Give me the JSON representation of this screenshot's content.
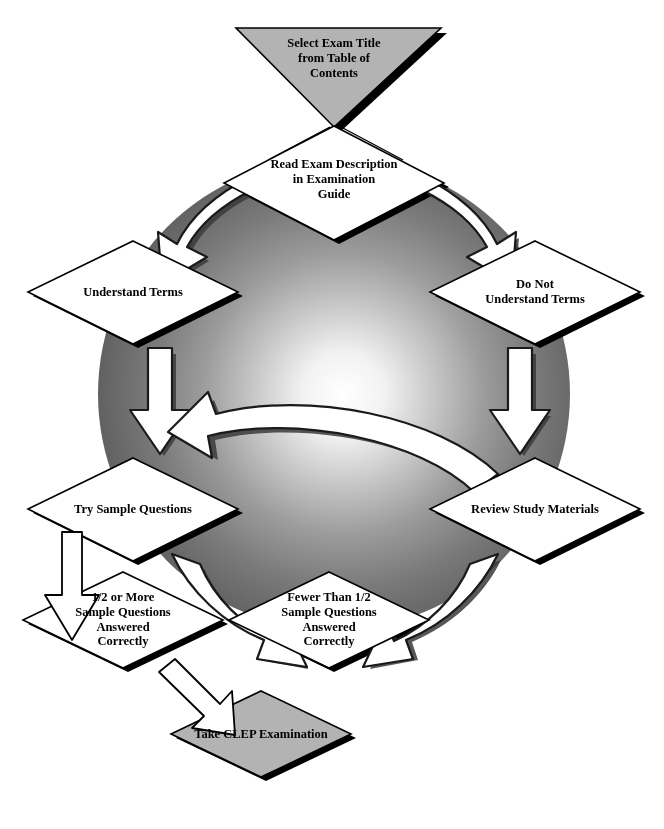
{
  "diagram": {
    "background_color": "#ffffff",
    "shape_fill_white": "#ffffff",
    "shape_fill_gray": "#b3b3b3",
    "shape_stroke": "#000000",
    "shadow_color": "#000000",
    "circle_edge_color": "#555555",
    "circle_center_color": "#ffffff",
    "arrow_fill": "#ffffff",
    "arrow_stroke": "#000000"
  },
  "nodes": [
    {
      "id": "select-exam-title",
      "shape": "triangle-down",
      "fill": "gray",
      "text": "Select Exam Title\nfrom Table of\nContents"
    },
    {
      "id": "read-exam-description",
      "shape": "diamond",
      "fill": "white",
      "text": "Read Exam Description\nin Examination\nGuide"
    },
    {
      "id": "understand-terms",
      "shape": "diamond",
      "fill": "white",
      "text": "Understand Terms"
    },
    {
      "id": "do-not-understand-terms",
      "shape": "diamond",
      "fill": "white",
      "text": "Do Not\nUnderstand Terms"
    },
    {
      "id": "try-sample-questions",
      "shape": "diamond",
      "fill": "white",
      "text": "Try Sample Questions"
    },
    {
      "id": "review-study-materials",
      "shape": "diamond",
      "fill": "white",
      "text": "Review Study Materials"
    },
    {
      "id": "half-or-more-correct",
      "shape": "diamond",
      "fill": "white",
      "text": "1/2 or More\nSample Questions\nAnswered\nCorrectly"
    },
    {
      "id": "fewer-than-half-correct",
      "shape": "diamond",
      "fill": "white",
      "text": "Fewer Than 1/2\nSample Questions\nAnswered\nCorrectly"
    },
    {
      "id": "take-clep-examination",
      "shape": "diamond",
      "fill": "gray",
      "text": "Take CLEP Examination"
    }
  ],
  "connectors": [
    {
      "id": "start-to-read",
      "style": "plain-line",
      "from": "select-exam-title",
      "to": "read-exam-description"
    },
    {
      "id": "read-to-understand",
      "style": "curved-block-arrow",
      "from": "read-exam-description",
      "to": "understand-terms"
    },
    {
      "id": "read-to-do-not-understand",
      "style": "curved-block-arrow",
      "from": "read-exam-description",
      "to": "do-not-understand-terms"
    },
    {
      "id": "understand-to-try",
      "style": "straight-block-arrow",
      "from": "understand-terms",
      "to": "try-sample-questions"
    },
    {
      "id": "do-not-understand-to-review",
      "style": "straight-block-arrow",
      "from": "do-not-understand-terms",
      "to": "review-study-materials"
    },
    {
      "id": "review-back-to-try",
      "style": "curved-block-arrow",
      "from": "review-study-materials",
      "to": "try-sample-questions"
    },
    {
      "id": "try-to-fewer",
      "style": "curved-block-arrow",
      "from": "try-sample-questions",
      "to": "fewer-than-half-correct"
    },
    {
      "id": "fewer-to-review",
      "style": "curved-block-arrow",
      "from": "fewer-than-half-correct",
      "to": "review-study-materials"
    },
    {
      "id": "try-to-half-or-more",
      "style": "outline-block-arrow",
      "from": "try-sample-questions",
      "to": "half-or-more-correct"
    },
    {
      "id": "half-or-more-to-take-exam",
      "style": "outline-block-arrow",
      "from": "half-or-more-correct",
      "to": "take-clep-examination"
    }
  ]
}
